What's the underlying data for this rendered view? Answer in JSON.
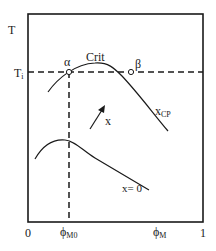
{
  "diagram": {
    "axes": {
      "y_label": "T",
      "x_origin_label": "0",
      "x_end_label": "1",
      "x_label_main": "ϕ",
      "x_label_main_sub": "M",
      "x_tick_label": "ϕ",
      "x_tick_label_sub": "M0",
      "y_tick_label": "T",
      "y_tick_label_sub": "i"
    },
    "curves": {
      "upper_label": "Crit",
      "upper_end_label": "x",
      "upper_end_label_sub": "CP",
      "lower_label": "x= 0"
    },
    "points": {
      "alpha": "α",
      "beta": "β"
    },
    "arrow_label": "x",
    "colors": {
      "line": "#1a1a1a",
      "background": "#ffffff"
    }
  }
}
